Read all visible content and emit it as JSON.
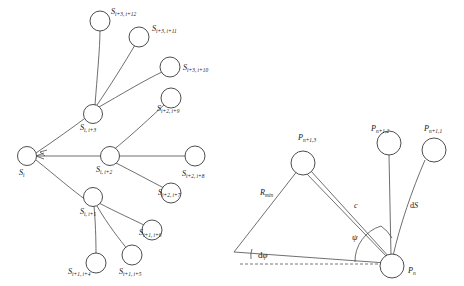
{
  "figure": {
    "title": "",
    "background": "#ffffff",
    "stroke_color": "#4a4a4a",
    "node_fill": "#ffffff"
  },
  "left_diagram": {
    "name": "segment-tree-diagram",
    "root": {
      "base": "S",
      "sub": "i"
    },
    "hubs": [
      {
        "id": "hub-i3",
        "base": "S",
        "sub": "i, i+3"
      },
      {
        "id": "hub-i2",
        "base": "S",
        "sub": "i, i+2"
      },
      {
        "id": "hub-i1",
        "base": "S",
        "sub": "i, i+1"
      }
    ],
    "leaves": [
      {
        "id": "leaf-i12",
        "base": "S",
        "sub": "i+3, i+12"
      },
      {
        "id": "leaf-i11",
        "base": "S",
        "sub": "i+3, i+11"
      },
      {
        "id": "leaf-i10",
        "base": "S",
        "sub": "i+3, i+10"
      },
      {
        "id": "leaf-i9",
        "base": "S",
        "sub": "i+2, i+9"
      },
      {
        "id": "leaf-i8",
        "base": "S",
        "sub": "i+2, i+8"
      },
      {
        "id": "leaf-i7",
        "base": "S",
        "sub": "i+2, i+7"
      },
      {
        "id": "leaf-i6",
        "base": "S",
        "sub": "i+1, i+6"
      },
      {
        "id": "leaf-i5",
        "base": "S",
        "sub": "i+1, i+5"
      },
      {
        "id": "leaf-i4",
        "base": "S",
        "sub": "i+1, i+4"
      }
    ]
  },
  "right_diagram": {
    "name": "path-geometry-diagram",
    "nodes": [
      {
        "id": "p-n",
        "base": "P",
        "sub": "n"
      },
      {
        "id": "p-n1-1",
        "base": "P",
        "sub": "n+1,1"
      },
      {
        "id": "p-n1-2",
        "base": "P",
        "sub": "n+1,2"
      },
      {
        "id": "p-n1-3",
        "base": "P",
        "sub": "n+1,3"
      }
    ],
    "annotations": [
      {
        "id": "r-min",
        "base": "R",
        "sub": "min"
      },
      {
        "id": "c-label",
        "text": "c"
      },
      {
        "id": "ds-label",
        "prefix": "d",
        "base": "S"
      },
      {
        "id": "psi-label",
        "text": "ψ"
      },
      {
        "id": "dpsi-label",
        "prefix": "d",
        "text": "φ"
      }
    ]
  }
}
